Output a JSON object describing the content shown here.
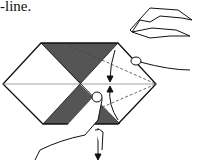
{
  "caption": "-line.",
  "diagram": {
    "elements": [
      "hexagon paper with shaded triangles",
      "valley fold dashed lines",
      "fold arrows",
      "hands folding paper"
    ],
    "colors": {
      "shade": "#555555",
      "line": "#111111",
      "paper": "#ffffff"
    }
  }
}
